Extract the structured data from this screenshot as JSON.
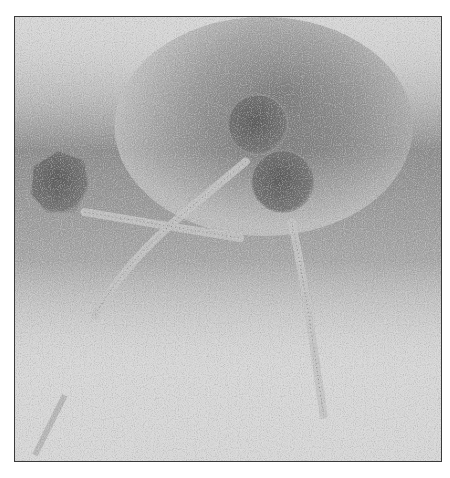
{
  "image": {
    "kind": "transmission electron micrograph",
    "subject": "three bacteriophage virions with icosahedral heads and long tails",
    "colors": {
      "background_light": "#d8d8d8",
      "background_dark": "#5a5a5a",
      "capsid": "#6e6e6e",
      "tail": "#bdbdbd",
      "frame_border": "#3a3a3a"
    },
    "phages": [
      {
        "id": "left",
        "head_center": [
          55,
          180
        ],
        "head_radius": 32,
        "tail_end": [
          240,
          235
        ]
      },
      {
        "id": "top",
        "head_center": [
          258,
          122
        ],
        "head_radius": 30,
        "tail_end": [
          92,
          320
        ]
      },
      {
        "id": "right",
        "head_center": [
          283,
          180
        ],
        "head_radius": 31,
        "tail_end": [
          320,
          420
        ]
      }
    ]
  }
}
